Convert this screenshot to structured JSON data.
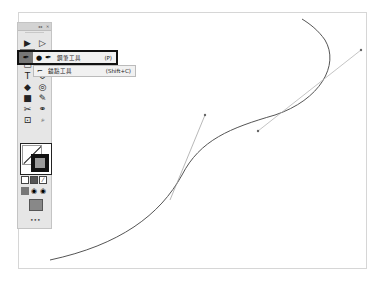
{
  "toolbar": {
    "header_controls": [
      "collapse",
      "close"
    ],
    "tools": [
      {
        "name": "selection-tool",
        "glyph": "▶"
      },
      {
        "name": "direct-selection-tool",
        "glyph": "▷"
      },
      {
        "name": "pen-tool",
        "glyph": "✒",
        "active": true
      },
      {
        "name": "rectangle-tool",
        "glyph": "▭"
      },
      {
        "name": "type-tool",
        "glyph": "T"
      },
      {
        "name": "rotate-tool",
        "glyph": "↺"
      },
      {
        "name": "paint-bucket-tool",
        "glyph": "◆"
      },
      {
        "name": "shape-builder-tool",
        "glyph": "◎"
      },
      {
        "name": "gradient-tool",
        "glyph": "■"
      },
      {
        "name": "eyedropper-tool",
        "glyph": "✎"
      },
      {
        "name": "symbol-sprayer-tool",
        "glyph": "✂"
      },
      {
        "name": "blend-tool",
        "glyph": "⚭"
      },
      {
        "name": "artboard-tool",
        "glyph": "⊡"
      },
      {
        "name": "zoom-tool",
        "glyph": "🔍"
      }
    ],
    "more": "•••"
  },
  "flyout": {
    "items": [
      {
        "label": "鋼筆工具",
        "shortcut": "(P)",
        "selected": true
      },
      {
        "label": "錨點工具",
        "shortcut": "(Shift+C)",
        "selected": false
      }
    ]
  },
  "colors": {
    "stroke": "#111111",
    "path": "#555555",
    "handle": "#999999",
    "toolbar_bg": "#e6e6e6",
    "active_tool": "#777777"
  }
}
